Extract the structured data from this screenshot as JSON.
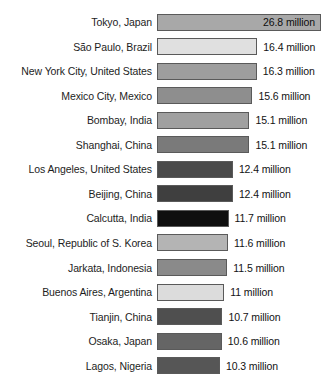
{
  "chart_data": {
    "type": "bar",
    "orientation": "horizontal",
    "title": "",
    "subtitle": "",
    "xlabel": "",
    "ylabel": "",
    "grid": false,
    "legend": false,
    "axis_visible": false,
    "value_suffix": "million",
    "xlim": [
      0,
      26.8
    ],
    "categories": [
      "Tokyo, Japan",
      "São Paulo, Brazil",
      "New York City, United States",
      "Mexico City, Mexico",
      "Bombay, India",
      "Shanghai, China",
      "Los Angeles, United States",
      "Beijing, China",
      "Calcutta, India",
      "Seoul, Republic of S. Korea",
      "Jarkata, Indonesia",
      "Buenos Aires, Argentina",
      "Tianjin, China",
      "Osaka, Japan",
      "Lagos, Nigeria"
    ],
    "values": [
      26.8,
      16.4,
      16.3,
      15.6,
      15.1,
      15.1,
      12.4,
      12.4,
      11.7,
      11.6,
      11.5,
      11,
      10.7,
      10.6,
      10.3
    ],
    "value_labels": [
      "26.8 million",
      "16.4 million",
      "16.3 million",
      "15.6 million",
      "15.1 million",
      "15.1 million",
      "12.4 million",
      "12.4 million",
      "11.7 million",
      "11.6 million",
      "11.5 million",
      "11 million",
      "10.7 million",
      "10.6 million",
      "10.3 million"
    ],
    "bar_colors": [
      "#a8a8a8",
      "#e0e0e0",
      "#9e9e9e",
      "#8e8e8e",
      "#a0a0a0",
      "#7a7a7a",
      "#4a4a4a",
      "#3f3f3f",
      "#0f0f0f",
      "#b4b4b4",
      "#8a8a8a",
      "#dcdcdc",
      "#4f4f4f",
      "#656565",
      "#565656"
    ],
    "label_inside_bar": [
      true,
      false,
      false,
      false,
      false,
      false,
      false,
      false,
      false,
      false,
      false,
      false,
      false,
      false,
      false
    ]
  }
}
